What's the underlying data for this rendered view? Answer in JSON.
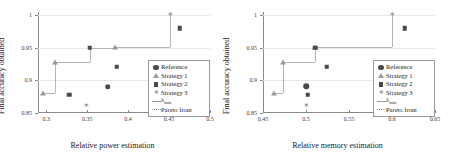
{
  "chart_data": [
    {
      "type": "scatter",
      "title": "",
      "xlabel": "Relative power estimation",
      "ylabel": "Final accuracy obtained",
      "xlim": [
        0.29,
        0.5
      ],
      "ylim": [
        0.85,
        1.005
      ],
      "xticks": [
        0.3,
        0.35,
        0.4,
        0.45,
        0.5
      ],
      "xticklabels": [
        "0.3",
        "0.35",
        "0.4",
        "0.45",
        "0.5"
      ],
      "yticks": [
        0.85,
        0.9,
        0.95,
        1
      ],
      "yticklabels": [
        "0.85",
        "0.9",
        "0.95",
        "1"
      ],
      "grid": true,
      "legend_position": "lower right",
      "series": [
        {
          "name": "Reference",
          "marker": "circle",
          "points": [
            {
              "x": 0.375,
              "y": 0.89
            }
          ]
        },
        {
          "name": "Strategy 1",
          "marker": "triangle",
          "points": [
            {
              "x": 0.296,
              "y": 0.88
            },
            {
              "x": 0.311,
              "y": 0.929
            },
            {
              "x": 0.384,
              "y": 0.952
            }
          ]
        },
        {
          "name": "Strategy 2",
          "marker": "square",
          "points": [
            {
              "x": 0.328,
              "y": 0.878
            },
            {
              "x": 0.386,
              "y": 0.921
            },
            {
              "x": 0.353,
              "y": 0.95
            },
            {
              "x": 0.463,
              "y": 0.98
            }
          ]
        },
        {
          "name": "Strategy 3",
          "marker": "star",
          "points": [
            {
              "x": 0.349,
              "y": 0.861
            },
            {
              "x": 0.451,
              "y": 1.0
            }
          ]
        }
      ],
      "pareto_front": {
        "name": "Pareto front",
        "style": "step",
        "points": [
          {
            "x": 0.296,
            "y": 0.88
          },
          {
            "x": 0.311,
            "y": 0.88
          },
          {
            "x": 0.311,
            "y": 0.929
          },
          {
            "x": 0.353,
            "y": 0.929
          },
          {
            "x": 0.353,
            "y": 0.95
          },
          {
            "x": 0.384,
            "y": 0.95
          },
          {
            "x": 0.384,
            "y": 0.952
          },
          {
            "x": 0.451,
            "y": 0.952
          },
          {
            "x": 0.451,
            "y": 1.0
          }
        ]
      }
    },
    {
      "type": "scatter",
      "title": "",
      "xlabel": "Relative memory estimation",
      "ylabel": "Final accuracy obtained",
      "xlim": [
        0.45,
        0.65
      ],
      "ylim": [
        0.85,
        1.005
      ],
      "xticks": [
        0.45,
        0.5,
        0.55,
        0.6,
        0.65
      ],
      "xticklabels": [
        "0.45",
        "0.5",
        "0.55",
        "0.6",
        "0.65"
      ],
      "yticks": [
        0.85,
        0.9,
        0.95,
        1
      ],
      "yticklabels": [
        "0.85",
        "0.9",
        "0.95",
        "1"
      ],
      "grid": true,
      "legend_position": "lower right",
      "series": [
        {
          "name": "Reference",
          "marker": "circle",
          "points": [
            {
              "x": 0.5,
              "y": 0.891
            }
          ]
        },
        {
          "name": "Strategy 1",
          "marker": "triangle",
          "points": [
            {
              "x": 0.463,
              "y": 0.88
            },
            {
              "x": 0.473,
              "y": 0.929
            },
            {
              "x": 0.511,
              "y": 0.952
            }
          ]
        },
        {
          "name": "Strategy 2",
          "marker": "square",
          "points": [
            {
              "x": 0.502,
              "y": 0.878
            },
            {
              "x": 0.524,
              "y": 0.921
            },
            {
              "x": 0.511,
              "y": 0.95
            },
            {
              "x": 0.615,
              "y": 0.98
            }
          ]
        },
        {
          "name": "Strategy 3",
          "marker": "star",
          "points": [
            {
              "x": 0.5,
              "y": 0.861
            },
            {
              "x": 0.6,
              "y": 1.0
            }
          ]
        }
      ],
      "pareto_front": {
        "name": "Pareto front",
        "style": "step",
        "points": [
          {
            "x": 0.463,
            "y": 0.88
          },
          {
            "x": 0.473,
            "y": 0.88
          },
          {
            "x": 0.473,
            "y": 0.929
          },
          {
            "x": 0.511,
            "y": 0.929
          },
          {
            "x": 0.511,
            "y": 0.952
          },
          {
            "x": 0.6,
            "y": 0.952
          },
          {
            "x": 0.6,
            "y": 1.0
          }
        ]
      }
    }
  ],
  "legend": {
    "items": [
      {
        "label": "Reference",
        "marker": "circle"
      },
      {
        "label": "Strategy 1",
        "marker": "triangle"
      },
      {
        "label": "Strategy 2",
        "marker": "square"
      },
      {
        "label": "Strategy 3",
        "marker": "star"
      },
      {
        "label": "λmin",
        "marker": "line"
      },
      {
        "label": "Pareto front",
        "marker": "dotted"
      }
    ]
  },
  "colors": {
    "marker_dark": "#4a4a4a",
    "marker_light": "#9a9a9a",
    "axis": "#8a8a8a",
    "grid": "#e8e8e8",
    "background": "#ffffff"
  }
}
